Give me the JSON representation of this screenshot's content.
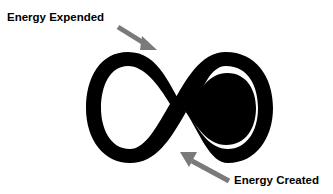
{
  "labels": {
    "top": "Energy Expended",
    "bottom": "Energy Created"
  },
  "symbol": {
    "name": "infinity",
    "color": "#000000"
  },
  "arrows": {
    "color": "#7a7a7a"
  }
}
